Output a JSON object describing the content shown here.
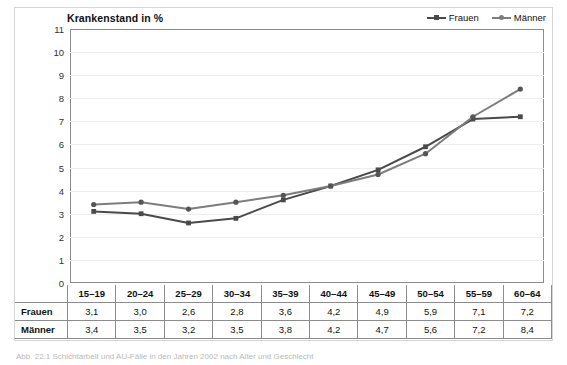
{
  "figure": {
    "caption": "Abb. 22.1 Schichtarbeit und AU-Fälle in den Jahren 2002 nach Alter und Geschlecht"
  },
  "chart_data": {
    "type": "line",
    "title": "Krankenstand in %",
    "xlabel": "",
    "ylabel": "",
    "ylim": [
      0,
      11
    ],
    "yticks": [
      11,
      10,
      9,
      8,
      7,
      6,
      5,
      4,
      3,
      2,
      1,
      0
    ],
    "grid": true,
    "legend_position": "top-right",
    "categories": [
      "15–19",
      "20–24",
      "25–29",
      "30–34",
      "35–39",
      "40–44",
      "45–49",
      "50–54",
      "55–59",
      "60–64"
    ],
    "series": [
      {
        "name": "Frauen",
        "color": "#4a4a4a",
        "marker": "square",
        "values": [
          3.1,
          3.0,
          2.6,
          2.8,
          3.6,
          4.2,
          4.9,
          5.9,
          7.1,
          7.2
        ],
        "labels": [
          "3,1",
          "3,0",
          "2,6",
          "2,8",
          "3,6",
          "4,2",
          "4,9",
          "5,9",
          "7,1",
          "7,2"
        ]
      },
      {
        "name": "Männer",
        "color": "#7d7d7d",
        "marker": "circle",
        "values": [
          3.4,
          3.5,
          3.2,
          3.5,
          3.8,
          4.2,
          4.7,
          5.6,
          7.2,
          8.4
        ],
        "labels": [
          "3,4",
          "3,5",
          "3,2",
          "3,5",
          "3,8",
          "4,2",
          "4,7",
          "5,6",
          "7,2",
          "8,4"
        ]
      }
    ]
  },
  "table": {
    "corner": "",
    "columns": [
      "15–19",
      "20–24",
      "25–29",
      "30–34",
      "35–39",
      "40–44",
      "45–49",
      "50–54",
      "55–59",
      "60–64"
    ],
    "rows": [
      {
        "label": "Frauen",
        "cells": [
          "3,1",
          "3,0",
          "2,6",
          "2,8",
          "3,6",
          "4,2",
          "4,9",
          "5,9",
          "7,1",
          "7,2"
        ]
      },
      {
        "label": "Männer",
        "cells": [
          "3,4",
          "3,5",
          "3,2",
          "3,5",
          "3,8",
          "4,2",
          "4,7",
          "5,6",
          "7,2",
          "8,4"
        ]
      }
    ]
  }
}
